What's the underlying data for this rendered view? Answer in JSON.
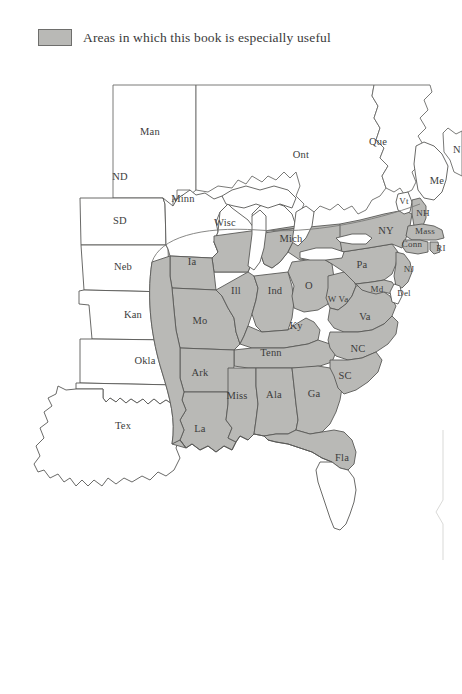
{
  "page": {
    "width": 462,
    "height": 694,
    "background_color": "#ffffff"
  },
  "legend": {
    "swatch_color": "#b9b9b6",
    "swatch_border_color": "#6e6e6c",
    "label": "Areas in which this book is especially useful"
  },
  "map": {
    "title": "",
    "shaded_color": "#b9b9b6",
    "unshaded_color": "#ffffff",
    "border_color": "#595957",
    "regions": [
      {
        "id": "man",
        "label": "Man",
        "x": 150,
        "y": 133,
        "shaded": false,
        "kind": "province"
      },
      {
        "id": "ont",
        "label": "Ont",
        "x": 301,
        "y": 156,
        "shaded": false,
        "kind": "province"
      },
      {
        "id": "que",
        "label": "Que",
        "x": 378,
        "y": 143,
        "shaded": false,
        "kind": "province"
      },
      {
        "id": "nb",
        "label": "N",
        "x": 457,
        "y": 151,
        "shaded": false,
        "kind": "province"
      },
      {
        "id": "nd",
        "label": "ND",
        "x": 120,
        "y": 178,
        "shaded": false,
        "kind": "state"
      },
      {
        "id": "sd",
        "label": "SD",
        "x": 120,
        "y": 222,
        "shaded": false,
        "kind": "state"
      },
      {
        "id": "neb",
        "label": "Neb",
        "x": 123,
        "y": 268,
        "shaded": false,
        "kind": "state"
      },
      {
        "id": "kan",
        "label": "Kan",
        "x": 133,
        "y": 316,
        "shaded": false,
        "kind": "state"
      },
      {
        "id": "okla",
        "label": "Okla",
        "x": 145,
        "y": 362,
        "shaded": false,
        "kind": "state"
      },
      {
        "id": "tex",
        "label": "Tex",
        "x": 123,
        "y": 427,
        "shaded": false,
        "kind": "state"
      },
      {
        "id": "minn",
        "label": "Minn",
        "x": 183,
        "y": 200,
        "shaded": false,
        "kind": "state"
      },
      {
        "id": "wisc",
        "label": "Wisc",
        "x": 225,
        "y": 224,
        "shaded": "partial",
        "kind": "state"
      },
      {
        "id": "ia",
        "label": "Ia",
        "x": 192,
        "y": 263,
        "shaded": true,
        "kind": "state"
      },
      {
        "id": "mo",
        "label": "Mo",
        "x": 200,
        "y": 322,
        "shaded": true,
        "kind": "state"
      },
      {
        "id": "ark",
        "label": "Ark",
        "x": 200,
        "y": 374,
        "shaded": true,
        "kind": "state"
      },
      {
        "id": "la",
        "label": "La",
        "x": 200,
        "y": 430,
        "shaded": true,
        "kind": "state"
      },
      {
        "id": "miss",
        "label": "Miss",
        "x": 237,
        "y": 397,
        "shaded": true,
        "kind": "state"
      },
      {
        "id": "ala",
        "label": "Ala",
        "x": 274,
        "y": 396,
        "shaded": true,
        "kind": "state"
      },
      {
        "id": "ga",
        "label": "Ga",
        "x": 314,
        "y": 395,
        "shaded": true,
        "kind": "state"
      },
      {
        "id": "fla",
        "label": "Fla",
        "x": 342,
        "y": 459,
        "shaded": "partial",
        "kind": "state"
      },
      {
        "id": "ill",
        "label": "Ill",
        "x": 236,
        "y": 292,
        "shaded": true,
        "kind": "state"
      },
      {
        "id": "ind",
        "label": "Ind",
        "x": 275,
        "y": 292,
        "shaded": true,
        "kind": "state"
      },
      {
        "id": "mich",
        "label": "Mich",
        "x": 291,
        "y": 240,
        "shaded": "partial",
        "kind": "state"
      },
      {
        "id": "oh",
        "label": "O",
        "x": 309,
        "y": 287,
        "shaded": true,
        "kind": "state"
      },
      {
        "id": "ky",
        "label": "Ky",
        "x": 296,
        "y": 327,
        "shaded": true,
        "kind": "state"
      },
      {
        "id": "tenn",
        "label": "Tenn",
        "x": 271,
        "y": 354,
        "shaded": true,
        "kind": "state"
      },
      {
        "id": "wva",
        "label": "W Va",
        "x": 338,
        "y": 300,
        "shaded": true,
        "kind": "state"
      },
      {
        "id": "va",
        "label": "Va",
        "x": 365,
        "y": 318,
        "shaded": true,
        "kind": "state"
      },
      {
        "id": "nc",
        "label": "NC",
        "x": 358,
        "y": 350,
        "shaded": true,
        "kind": "state"
      },
      {
        "id": "sc",
        "label": "SC",
        "x": 345,
        "y": 377,
        "shaded": true,
        "kind": "state"
      },
      {
        "id": "pa",
        "label": "Pa",
        "x": 362,
        "y": 266,
        "shaded": true,
        "kind": "state"
      },
      {
        "id": "md",
        "label": "Md",
        "x": 377,
        "y": 290,
        "shaded": true,
        "kind": "state"
      },
      {
        "id": "del",
        "label": "Del",
        "x": 404,
        "y": 294,
        "shaded": false,
        "kind": "state"
      },
      {
        "id": "nj",
        "label": "NJ",
        "x": 409,
        "y": 270,
        "shaded": true,
        "kind": "state"
      },
      {
        "id": "ny",
        "label": "NY",
        "x": 386,
        "y": 232,
        "shaded": true,
        "kind": "state"
      },
      {
        "id": "vt",
        "label": "Vt",
        "x": 404,
        "y": 202,
        "shaded": false,
        "kind": "state"
      },
      {
        "id": "nh",
        "label": "NH",
        "x": 423,
        "y": 214,
        "shaded": true,
        "kind": "state"
      },
      {
        "id": "mass",
        "label": "Mass",
        "x": 425,
        "y": 232,
        "shaded": true,
        "kind": "state"
      },
      {
        "id": "conn",
        "label": "Conn",
        "x": 412,
        "y": 245,
        "shaded": true,
        "kind": "state"
      },
      {
        "id": "ri",
        "label": "RI",
        "x": 441,
        "y": 249,
        "shaded": true,
        "kind": "state"
      },
      {
        "id": "me",
        "label": "Me",
        "x": 437,
        "y": 182,
        "shaded": false,
        "kind": "state"
      }
    ]
  }
}
